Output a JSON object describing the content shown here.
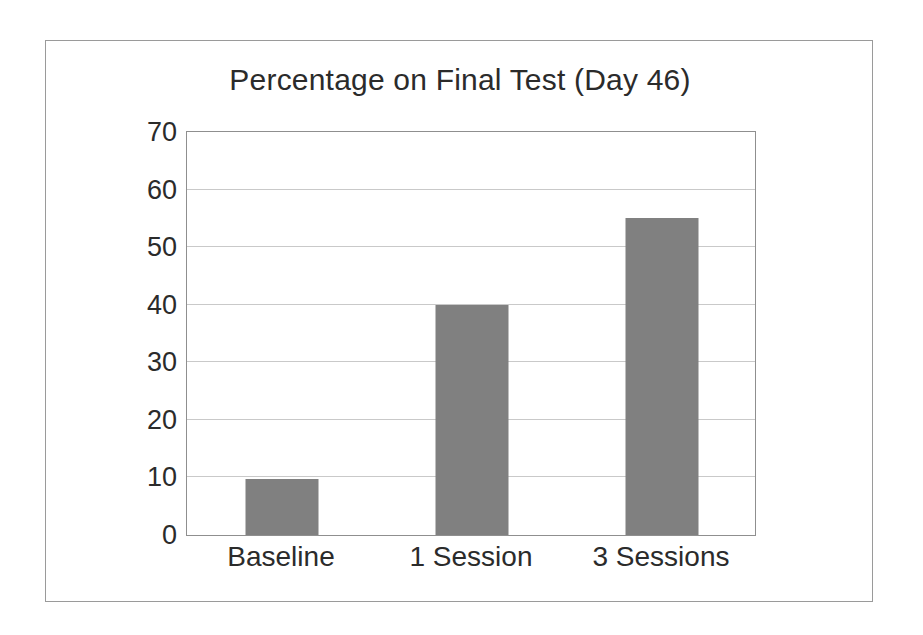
{
  "chart_data": {
    "type": "bar",
    "title": "Percentage on Final Test (Day 46)",
    "xlabel": "",
    "ylabel": "",
    "categories": [
      "Baseline",
      "1 Session",
      "3 Sessions"
    ],
    "values": [
      9.7,
      40,
      55
    ],
    "ylim": [
      0,
      70
    ],
    "yticks": [
      0,
      10,
      20,
      30,
      40,
      50,
      60,
      70
    ],
    "ytick_labels": [
      "0",
      "10",
      "20",
      "30",
      "40",
      "50",
      "60",
      "70"
    ],
    "grid": "horizontal",
    "legend": "none",
    "series": [
      {
        "name": "Percentage on Final Test",
        "values": [
          9.7,
          40,
          55
        ]
      }
    ],
    "colors": {
      "bar_fill": "#808080",
      "gridline": "#c9c9c9",
      "axis": "#8f8f8f",
      "frame": "#9a9a9a",
      "text": "#2b2b2b",
      "background": "#ffffff"
    }
  }
}
